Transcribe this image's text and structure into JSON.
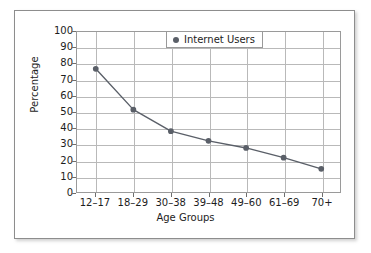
{
  "chart_data": {
    "type": "line",
    "title": "",
    "xlabel": "Age Groups",
    "ylabel": "Percentage",
    "categories": [
      "12–17",
      "18–29",
      "30–38",
      "39–48",
      "49–60",
      "61–69",
      "70+"
    ],
    "series": [
      {
        "name": "Internet Users",
        "values": [
          77,
          51.5,
          38,
          32,
          27.5,
          21.5,
          14.5
        ],
        "color": "#5a5f68",
        "marker": "circle"
      }
    ],
    "ylim": [
      0,
      100
    ],
    "yticks": [
      0,
      10,
      20,
      30,
      40,
      50,
      60,
      70,
      80,
      90,
      100
    ],
    "ytick_labels": [
      "0",
      "10",
      "20",
      "30",
      "40",
      "50",
      "60",
      "70",
      "80",
      "90",
      "100"
    ],
    "grid": "both",
    "legend_position": "top-right"
  },
  "legend": {
    "entries": [
      {
        "label": "Internet Users",
        "marker_color": "#5a5f68"
      }
    ]
  },
  "axes": {
    "x_title": "Age Groups",
    "y_title": "Percentage"
  },
  "colors": {
    "series_line": "#5a5f68",
    "gridline": "#b9b9b9",
    "axis_line": "#9a9a9a",
    "frame_border": "#8d8d8d",
    "text": "#1d1d1d",
    "background": "#ffffff"
  }
}
